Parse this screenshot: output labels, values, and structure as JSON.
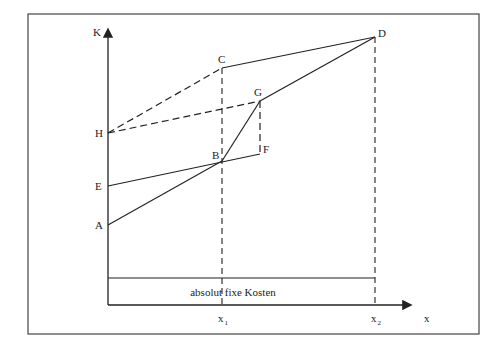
{
  "diagram": {
    "frame": {
      "x": 28,
      "y": 14,
      "w": 451,
      "h": 320
    },
    "axes": {
      "y_label": "K",
      "x_label": "x",
      "origin": {
        "x": 108,
        "y": 305
      },
      "y_top": 30,
      "x_right": 410
    },
    "fixed_cost": {
      "label": "absolut fixe Kosten",
      "line_y": 278
    },
    "ticks": [
      {
        "name": "x1",
        "base": "x",
        "sub": "1",
        "x": 222
      },
      {
        "name": "x2",
        "base": "x",
        "sub": "2",
        "x": 375
      }
    ],
    "points": {
      "A": {
        "label": "A",
        "x": 108,
        "y": 225
      },
      "E": {
        "label": "E",
        "x": 108,
        "y": 186
      },
      "H": {
        "label": "H",
        "x": 108,
        "y": 133
      },
      "B": {
        "label": "B",
        "x": 222,
        "y": 161
      },
      "C": {
        "label": "C",
        "x": 222,
        "y": 68
      },
      "F": {
        "label": "F",
        "x": 260,
        "y": 154
      },
      "G": {
        "label": "G",
        "x": 260,
        "y": 101
      },
      "D": {
        "label": "D",
        "x": 375,
        "y": 37
      }
    },
    "solid_segments": [
      [
        "A",
        "B"
      ],
      [
        "E",
        "F"
      ],
      [
        "C",
        "D"
      ],
      [
        "B",
        "G"
      ],
      [
        "G",
        "D"
      ]
    ],
    "dashed_segments": [
      [
        "H",
        "C"
      ],
      [
        "H",
        "G"
      ],
      [
        "G",
        "F"
      ]
    ],
    "dashed_verticals": [
      {
        "x": 222,
        "from_y": 68,
        "to_y": 305
      },
      {
        "x": 375,
        "from_y": 37,
        "to_y": 305
      }
    ]
  }
}
